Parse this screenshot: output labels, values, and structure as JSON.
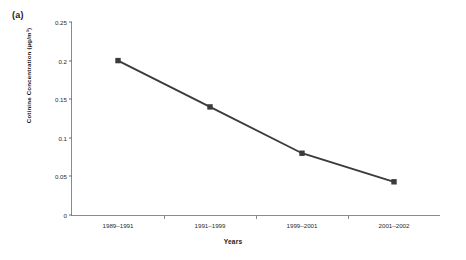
{
  "panel": {
    "label": "(a)"
  },
  "chart_data": {
    "type": "line",
    "title": "",
    "subtitle": "",
    "xlabel": "Years",
    "ylabel": "Cotinine Concentration (µg/m³)",
    "categories": [
      "1989–1991",
      "1991–1999",
      "1999–2001",
      "2001–2002"
    ],
    "values": [
      0.2,
      0.14,
      0.08,
      0.043
    ],
    "series": [
      {
        "name": "Cotinine Concentration",
        "values": [
          0.2,
          0.14,
          0.08,
          0.043
        ],
        "color": "#3b3b3b",
        "marker": "square"
      }
    ],
    "ylim": [
      0,
      0.25
    ],
    "yticks": [
      0,
      0.05,
      0.1,
      0.15,
      0.2,
      0.25
    ],
    "ytick_labels": [
      "0",
      "0.05",
      "0.1",
      "0.15",
      "0.2",
      "0.25"
    ],
    "grid": false,
    "legend": false,
    "legend_position": "none",
    "axis_color": "#8a8a8a"
  }
}
